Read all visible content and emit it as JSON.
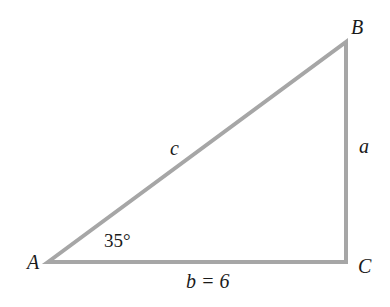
{
  "diagram": {
    "type": "right-triangle",
    "stroke_color": "#a6a6a6",
    "vertices": {
      "A": {
        "label": "A",
        "x": 48,
        "y": 262
      },
      "B": {
        "label": "B",
        "x": 346,
        "y": 42
      },
      "C": {
        "label": "C",
        "x": 346,
        "y": 262
      }
    },
    "sides": {
      "a": {
        "label": "a"
      },
      "b": {
        "label": "b = 6",
        "value": 6
      },
      "c": {
        "label": "c"
      }
    },
    "angles": {
      "A": {
        "label": "35°",
        "value": 35
      }
    }
  }
}
